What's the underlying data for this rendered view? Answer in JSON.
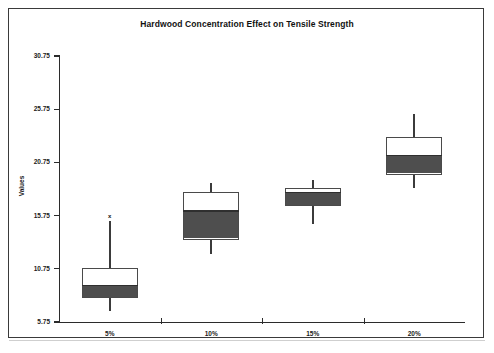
{
  "chart_data": {
    "type": "box",
    "title": "Hardwood Concentration Effect on Tensile Strength",
    "xlabel": "",
    "ylabel": "Values",
    "ylim": [
      5.75,
      30.75
    ],
    "yticks": [
      5.75,
      10.75,
      15.75,
      20.75,
      25.75,
      30.75
    ],
    "ytick_labels": [
      "5.75",
      "10.75",
      "15.75",
      "20.75",
      "25.75",
      "30.75"
    ],
    "grid": false,
    "legend": "none",
    "categories": [
      "5%",
      "10%",
      "15%",
      "20%"
    ],
    "boxes": [
      {
        "category": "5%",
        "whisker_low": 6.8,
        "q1": 8.0,
        "median": 9.2,
        "q3": 10.8,
        "whisker_high": 15.25,
        "outliers": [
          15.7
        ]
      },
      {
        "category": "10%",
        "whisker_low": 12.1,
        "q1": 13.5,
        "median": 16.2,
        "q3": 18.0,
        "whisker_high": 18.8,
        "outliers": []
      },
      {
        "category": "15%",
        "whisker_low": 14.95,
        "q1": 16.65,
        "median": 17.9,
        "q3": 18.3,
        "whisker_high": 19.1,
        "outliers": []
      },
      {
        "category": "20%",
        "whisker_low": 18.3,
        "q1": 19.6,
        "median": 21.4,
        "q3": 23.1,
        "whisker_high": 25.3,
        "outliers": []
      }
    ],
    "outlier_glyph": "x",
    "colors": {
      "box_fill_upper": "#ffffff",
      "box_fill_lower": "#4e4e4e",
      "box_border": "#4a4a4a",
      "whisker": "#3b3b3b",
      "median": "#2f2f2f",
      "axis": "#2b2b2b",
      "text": "#1a1a1a",
      "background": "#ffffff",
      "frame": "#3a3a3a"
    }
  }
}
